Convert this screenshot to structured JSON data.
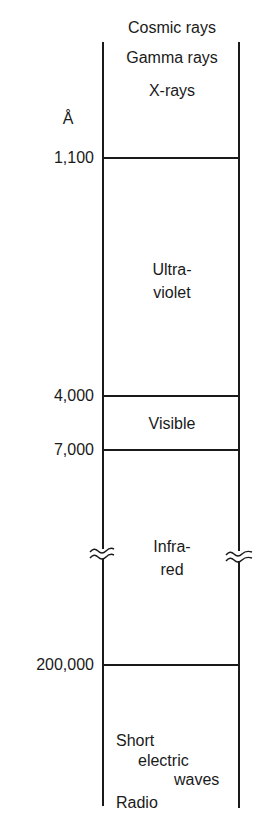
{
  "diagram": {
    "unit": "Å",
    "top_labels": [
      "Cosmic rays",
      "Gamma rays",
      "X-rays"
    ],
    "boundaries": [
      {
        "value": "1,100"
      },
      {
        "value": "4,000"
      },
      {
        "value": "7,000"
      },
      {
        "value": "200,000"
      }
    ],
    "regions": {
      "ultraviolet": [
        "Ultra-",
        "violet"
      ],
      "visible": "Visible",
      "infrared": [
        "Infra-",
        "red"
      ],
      "bottom": {
        "line1": "Short",
        "line2": "electric",
        "line3": "waves",
        "line4": "Radio"
      }
    },
    "break_symbol": "axis-break",
    "line_color": "#1a1a1a",
    "background": "#ffffff"
  }
}
